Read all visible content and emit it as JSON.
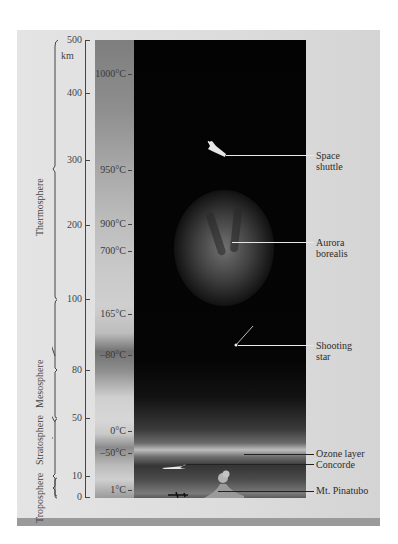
{
  "diagram": {
    "altitude_axis": {
      "unit": "km",
      "ticks": [
        {
          "label": "500",
          "value": 500,
          "y": 40
        },
        {
          "label": "400",
          "value": 400,
          "y": 93
        },
        {
          "label": "300",
          "value": 300,
          "y": 160
        },
        {
          "label": "200",
          "value": 200,
          "y": 225
        },
        {
          "label": "100",
          "value": 100,
          "y": 299
        },
        {
          "label": "80",
          "value": 80,
          "y": 370
        },
        {
          "label": "50",
          "value": 50,
          "y": 418
        },
        {
          "label": "10",
          "value": 10,
          "y": 476
        },
        {
          "label": "0",
          "value": 0,
          "y": 497
        }
      ]
    },
    "temperatures": [
      {
        "label": "1000°C",
        "y": 74
      },
      {
        "label": "950°C",
        "y": 170
      },
      {
        "label": "900°C",
        "y": 224
      },
      {
        "label": "700°C",
        "y": 251
      },
      {
        "label": "165°C",
        "y": 314
      },
      {
        "label": "–80°C",
        "y": 355
      },
      {
        "label": "0°C",
        "y": 431
      },
      {
        "label": "–50°C",
        "y": 453
      },
      {
        "label": "1°C",
        "y": 490
      }
    ],
    "regions": [
      {
        "name": "Thermosphere",
        "from_km": 100,
        "to_km": 500
      },
      {
        "name": "Mesosphere",
        "from_km": 50,
        "to_km": 80
      },
      {
        "name": "Stratosphere",
        "from_km": 10,
        "to_km": 50
      },
      {
        "name": "Troposphere",
        "from_km": 0,
        "to_km": 10
      }
    ],
    "callouts": [
      {
        "id": "space-shuttle",
        "line1": "Space",
        "line2": "shuttle",
        "y": 155
      },
      {
        "id": "aurora-borealis",
        "line1": "Aurora",
        "line2": "borealis",
        "y": 242
      },
      {
        "id": "shooting-star",
        "line1": "Shooting",
        "line2": "star",
        "y": 345
      },
      {
        "id": "ozone-layer",
        "line1": "Ozone layer",
        "line2": "",
        "y": 453
      },
      {
        "id": "concorde",
        "line1": "Concorde",
        "line2": "",
        "y": 463
      },
      {
        "id": "mt-pinatubo",
        "line1": "Mt. Pinatubo",
        "line2": "",
        "y": 490
      }
    ]
  },
  "colors": {
    "panel": "#dcdcdc",
    "sky": "#050505",
    "bottom_bar": "#9a9a9a",
    "text": "#333333"
  }
}
